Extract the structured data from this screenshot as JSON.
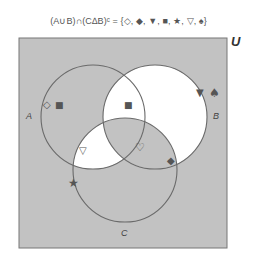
{
  "title": "(A∪B)∩(C∆B)ᶜ = {◇, ◆, ▼, ■, ★, ▽, ♠}",
  "universe": {
    "label": "U",
    "x": 19,
    "y": 38,
    "width": 208,
    "height": 210,
    "fill": "#c2c2c2"
  },
  "sets": [
    {
      "name": "A",
      "label": "A",
      "cx": 93,
      "cy": 117,
      "r": 52,
      "label_x": 29,
      "label_y": 119
    },
    {
      "name": "B",
      "label": "B",
      "cx": 155,
      "cy": 117,
      "r": 52,
      "label_x": 213,
      "label_y": 119
    },
    {
      "name": "C",
      "label": "C",
      "cx": 125,
      "cy": 170,
      "r": 52,
      "label_x": 121,
      "label_y": 236
    }
  ],
  "shaded_regions": {
    "description": "White regions highlight (A∪B)∩(C∆B)ᶜ",
    "white": [
      "B only (not A, not C)",
      "A∩B only (not C)",
      "A∩C only (not B)"
    ],
    "highlight_color": "#ffffff"
  },
  "elements": [
    {
      "symbol": "◇",
      "name": "diamond-outline",
      "x": 47,
      "y": 104,
      "region": "A only"
    },
    {
      "symbol": "■",
      "name": "square",
      "x": 59,
      "y": 104,
      "region": "A only"
    },
    {
      "symbol": "■",
      "name": "square",
      "x": 128,
      "y": 104,
      "region": "A∩B only"
    },
    {
      "symbol": "▼",
      "name": "triangle-down-filled",
      "x": 201,
      "y": 92,
      "region": "B only"
    },
    {
      "symbol": "♠",
      "name": "spade",
      "x": 214,
      "y": 92,
      "region": "outside"
    },
    {
      "symbol": "▽",
      "name": "triangle-down-outline",
      "x": 84,
      "y": 150,
      "region": "A∩C only"
    },
    {
      "symbol": "♡",
      "name": "heart-outline",
      "x": 140,
      "y": 148,
      "region": "A∩B∩C"
    },
    {
      "symbol": "◆",
      "name": "diamond-filled",
      "x": 172,
      "y": 162,
      "region": "B∩C boundary"
    },
    {
      "symbol": "★",
      "name": "star",
      "x": 74,
      "y": 186,
      "region": "C boundary"
    }
  ]
}
